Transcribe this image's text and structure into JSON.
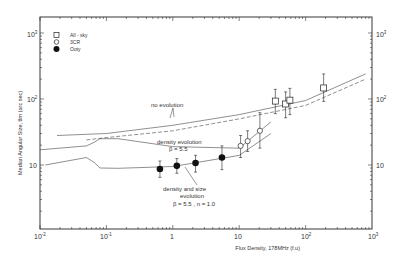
{
  "chart_data": {
    "type": "scatter",
    "title": "",
    "xlabel": "Flux Density, 178MHz (f.u)",
    "ylabel": "Median Angular Size, θm (arc sec)",
    "xscale": "log",
    "yscale": "log",
    "xlim": [
      0.01,
      1000
    ],
    "ylim": [
      1,
      1700
    ],
    "x_ticks": [
      "10^-2",
      "10^-1",
      "1",
      "10",
      "10^2",
      "10^3"
    ],
    "y_ticks": [
      "10",
      "10^2",
      "10^3"
    ],
    "y_ticks_right": [
      "10",
      "10^2",
      "10^3"
    ],
    "grid": false,
    "legend_position": "upper left",
    "legend": [
      {
        "marker": "open-square",
        "label": "All - sky"
      },
      {
        "marker": "open-circle",
        "label": "3CR"
      },
      {
        "marker": "filled-circle",
        "label": "Ooty"
      }
    ],
    "series": [
      {
        "name": "All - sky",
        "marker": "open-square",
        "x": [
          35,
          50,
          58,
          187
        ],
        "y": [
          93,
          84,
          96,
          147
        ],
        "y_err_low": [
          60,
          52,
          58,
          92
        ],
        "y_err_high": [
          140,
          128,
          145,
          240
        ]
      },
      {
        "name": "3CR",
        "marker": "open-circle",
        "x": [
          10.5,
          13.4,
          20.5
        ],
        "y": [
          19.5,
          23,
          33
        ],
        "y_err_low": [
          13,
          16,
          18
        ],
        "y_err_high": [
          28,
          33,
          62
        ]
      },
      {
        "name": "Ooty",
        "marker": "filled-circle",
        "x": [
          0.64,
          1.15,
          2.2,
          5.5
        ],
        "y": [
          8.7,
          9.7,
          10.7,
          13
        ],
        "y_err_low": [
          6.5,
          7.5,
          7.8,
          8.5
        ],
        "y_err_high": [
          11.5,
          12.5,
          14,
          19.5
        ]
      }
    ],
    "curves": [
      {
        "name": "no evolution",
        "style": "solid",
        "x": [
          0.018,
          0.1,
          1,
          10,
          100,
          800
        ],
        "y": [
          28,
          30,
          40,
          58,
          95,
          240
        ]
      },
      {
        "name": "no evolution (lower)",
        "style": "dashed",
        "x": [
          0.05,
          0.1,
          1,
          10,
          100,
          800
        ],
        "y": [
          24,
          26,
          33,
          50,
          80,
          200
        ]
      },
      {
        "name": "density evolution β=5.5",
        "style": "solid",
        "x": [
          0.01,
          0.05,
          0.065,
          0.08,
          0.15,
          1,
          10,
          30
        ],
        "y": [
          17,
          19.5,
          22,
          25,
          25,
          19,
          18,
          45
        ]
      },
      {
        "name": "density and size evolution β=5.5, n=1.0",
        "style": "solid",
        "x": [
          0.012,
          0.05,
          0.065,
          0.08,
          0.15,
          1,
          10,
          30
        ],
        "y": [
          10,
          13,
          11,
          9,
          8.9,
          9.5,
          14,
          30
        ]
      }
    ],
    "annotations": [
      {
        "text": "no evolution",
        "x": 0.5,
        "y": 60
      },
      {
        "text": "density evolution",
        "x": 1.2,
        "y": 26
      },
      {
        "text": "β = 5.5",
        "x": 1.2,
        "y": 22
      },
      {
        "text": "density and size",
        "x": 1.5,
        "y": 5.5
      },
      {
        "text": "evolution",
        "x": 1.5,
        "y": 4.7
      },
      {
        "text": "β = 5.5 , n = 1.0",
        "x": 1.5,
        "y": 3.8
      }
    ]
  },
  "axes": {
    "xlabel": "Flux Density, 178MHz (f.u)",
    "ylabel": "Median Angular Size, θm (arc sec)",
    "x_tick_labels": [
      {
        "base": "10",
        "exp": "-2"
      },
      {
        "base": "10",
        "exp": "-1"
      },
      {
        "base": "1",
        "exp": ""
      },
      {
        "base": "10",
        "exp": ""
      },
      {
        "base": "10",
        "exp": "2"
      },
      {
        "base": "10",
        "exp": "3"
      }
    ],
    "y_tick_labels": [
      {
        "base": "10",
        "exp": ""
      },
      {
        "base": "10",
        "exp": "2"
      },
      {
        "base": "10",
        "exp": "3"
      }
    ]
  },
  "legend": {
    "items": [
      {
        "label": "All - sky"
      },
      {
        "label": "3CR"
      },
      {
        "label": "Ooty"
      }
    ]
  },
  "annotations": {
    "no_evolution": "no evolution",
    "density_evolution": "density evolution",
    "density_beta": "β = 5.5",
    "density_size_1": "density and size",
    "density_size_2": "evolution",
    "density_size_3": "β = 5.5 , n = 1.0"
  }
}
